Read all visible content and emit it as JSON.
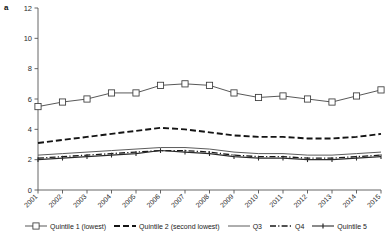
{
  "panel": {
    "label": "a"
  },
  "chart_data": {
    "type": "line",
    "title": "",
    "xlabel": "",
    "ylabel": "",
    "grid": false,
    "legend_position": "bottom",
    "xlim": [
      2001,
      2015
    ],
    "ylim": [
      0,
      12
    ],
    "ytick_step": 2,
    "yticks": [
      "0",
      "2",
      "4",
      "6",
      "8",
      "10",
      "12"
    ],
    "categories": [
      "2001",
      "2002",
      "2003",
      "2004",
      "2005",
      "2006",
      "2007",
      "2008",
      "2009",
      "2010",
      "2011",
      "2012",
      "2013",
      "2014",
      "2015"
    ],
    "series": [
      {
        "name": "Quintile 1 (lowest)",
        "legend_label": "Quintile 1 (lowest)",
        "style": "solid-square-marker",
        "color": "#3a3a3a",
        "values": [
          5.5,
          5.8,
          6.0,
          6.4,
          6.4,
          6.9,
          7.0,
          6.9,
          6.4,
          6.1,
          6.2,
          6.0,
          5.8,
          6.2,
          6.6
        ]
      },
      {
        "name": "Quintile 2 (second lowest)",
        "legend_label": "Quintile 2 (second lowest)",
        "style": "dashed",
        "color": "#141414",
        "values": [
          3.1,
          3.3,
          3.5,
          3.7,
          3.9,
          4.1,
          4.0,
          3.8,
          3.6,
          3.5,
          3.5,
          3.4,
          3.4,
          3.5,
          3.7
        ]
      },
      {
        "name": "Q3",
        "legend_label": "Q3",
        "style": "solid-thin",
        "color": "#4a4a4a",
        "values": [
          2.3,
          2.4,
          2.5,
          2.6,
          2.7,
          2.8,
          2.8,
          2.7,
          2.5,
          2.4,
          2.4,
          2.3,
          2.3,
          2.4,
          2.5
        ]
      },
      {
        "name": "Q4",
        "legend_label": "Q4",
        "style": "dash-dot",
        "color": "#181818",
        "values": [
          2.1,
          2.2,
          2.3,
          2.4,
          2.5,
          2.6,
          2.6,
          2.5,
          2.3,
          2.2,
          2.2,
          2.1,
          2.1,
          2.2,
          2.3
        ]
      },
      {
        "name": "Quintile 5",
        "legend_label": "Quintile 5",
        "style": "solid-tick-marker",
        "color": "#2a2a2a",
        "values": [
          2.0,
          2.1,
          2.2,
          2.3,
          2.4,
          2.6,
          2.5,
          2.4,
          2.2,
          2.1,
          2.1,
          2.0,
          2.0,
          2.1,
          2.2
        ]
      }
    ]
  }
}
